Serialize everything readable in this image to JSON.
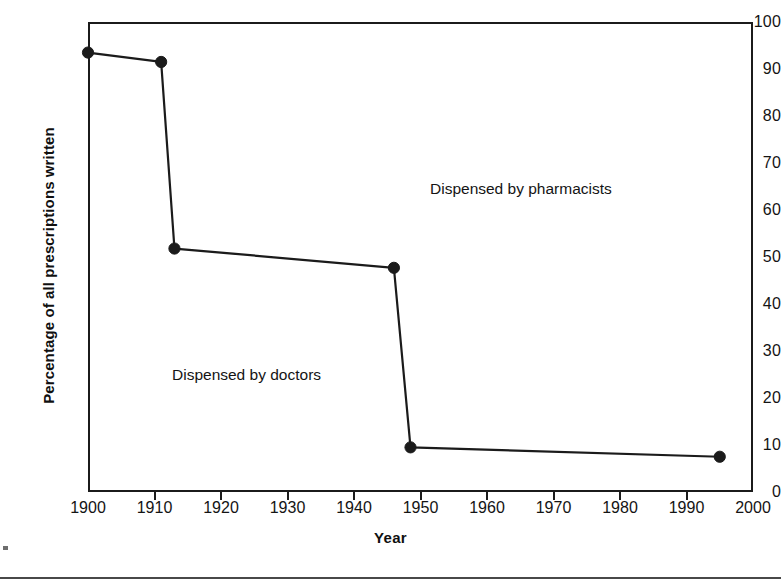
{
  "chart_data": {
    "type": "line",
    "title": "",
    "subtitle": "",
    "xlabel": "Year",
    "ylabel": "Percentage of all prescriptions written",
    "xlim": [
      1900,
      2000
    ],
    "ylim": [
      0,
      100
    ],
    "grid": false,
    "legend_position": "none",
    "xticks": [
      1900,
      1910,
      1920,
      1930,
      1940,
      1950,
      1960,
      1970,
      1980,
      1990,
      2000
    ],
    "xtick_labels": [
      "1900",
      "1910",
      "1920",
      "1930",
      "1940",
      "1950",
      "1960",
      "1970",
      "1980",
      "1990",
      "2000"
    ],
    "yticks": [
      0,
      10,
      20,
      30,
      40,
      50,
      60,
      70,
      80,
      90,
      100
    ],
    "ytick_labels": [
      "0",
      "10",
      "20",
      "30",
      "40",
      "50",
      "60",
      "70",
      "80",
      "90",
      "100"
    ],
    "series": [
      {
        "name": "Percentage of all prescriptions written",
        "marker": "filled-circle",
        "color": "#1b1b1b",
        "x": [
          1900,
          1911,
          1913,
          1946,
          1948.5,
          1995
        ],
        "values": [
          93.5,
          91.5,
          51.8,
          47.7,
          9.5,
          7.5
        ]
      }
    ],
    "annotations": [
      {
        "text": "Dispensed by pharmacists",
        "x": 1952,
        "y": 63
      },
      {
        "text": "Dispensed by doctors",
        "x": 1913,
        "y": 24
      }
    ]
  },
  "axes": {
    "ylabel": "Percentage of all prescriptions written",
    "xlabel": "Year"
  }
}
